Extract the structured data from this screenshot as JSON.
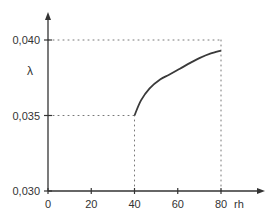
{
  "chart_data": {
    "type": "line",
    "title": "",
    "xlabel": "rh",
    "ylabel": "λ",
    "xlim": [
      0,
      88
    ],
    "ylim": [
      0.03,
      0.041
    ],
    "x_ticks": [
      0,
      20,
      40,
      60,
      80
    ],
    "x_tick_labels": [
      "0",
      "20",
      "40",
      "60",
      "80"
    ],
    "y_ticks": [
      0.03,
      0.035,
      0.04
    ],
    "y_tick_labels": [
      "0,030",
      "0,035",
      "0,040"
    ],
    "grid": false,
    "legend": null,
    "series": [
      {
        "name": "λ(rh)",
        "x": [
          40,
          43,
          47,
          52,
          56,
          61,
          66,
          70,
          75,
          80
        ],
        "y": [
          0.035,
          0.036,
          0.0368,
          0.0374,
          0.0377,
          0.0381,
          0.0385,
          0.0388,
          0.0391,
          0.0393
        ]
      }
    ],
    "reference_lines": [
      {
        "type": "horizontal",
        "y": 0.04,
        "from_x": 0,
        "to_x": 80,
        "style": "dotted"
      },
      {
        "type": "horizontal",
        "y": 0.035,
        "from_x": 0,
        "to_x": 40,
        "style": "dotted"
      },
      {
        "type": "vertical",
        "x": 40,
        "from_y": 0.03,
        "to_y": 0.035,
        "style": "dotted"
      },
      {
        "type": "vertical",
        "x": 80,
        "from_y": 0.03,
        "to_y": 0.04,
        "style": "dotted"
      }
    ]
  },
  "colors": {
    "axis": "#333333",
    "curve": "#3a3a3a",
    "dotted": "#777777"
  }
}
